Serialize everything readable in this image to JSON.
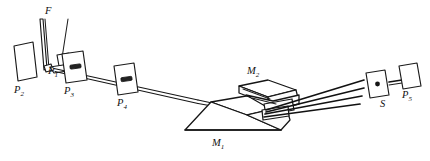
{
  "figure": {
    "background_color": "#ffffff",
    "stroke_color": "#1a1a1a",
    "width": 430,
    "height": 161,
    "type": "line-diagram"
  },
  "labels": {
    "f": {
      "text": "F",
      "subscript": "",
      "x": 45,
      "y": 6
    },
    "p1": {
      "text": "P",
      "subscript": "1",
      "x": 48,
      "y": 66
    },
    "p2": {
      "text": "P",
      "subscript": "2",
      "x": 14,
      "y": 96
    },
    "p3": {
      "text": "P",
      "subscript": "3",
      "x": 62,
      "y": 84
    },
    "p4": {
      "text": "P",
      "subscript": "4",
      "x": 115,
      "y": 100
    },
    "m1": {
      "text": "M",
      "subscript": "1",
      "x": 212,
      "y": 141
    },
    "m2": {
      "text": "M",
      "subscript": "2",
      "x": 247,
      "y": 67
    },
    "s": {
      "text": "S",
      "subscript": "",
      "x": 382,
      "y": 98
    },
    "p5": {
      "text": "P",
      "subscript": "5",
      "x": 401,
      "y": 90
    }
  },
  "components": [
    {
      "name": "plate-p2",
      "label": "P2",
      "kind": "tilted-plate"
    },
    {
      "name": "filament-f",
      "label": "F",
      "kind": "filament-slit"
    },
    {
      "name": "mount-p1",
      "label": "P1",
      "kind": "small-block-mount"
    },
    {
      "name": "plate-p3",
      "label": "P3",
      "kind": "slotted-plate"
    },
    {
      "name": "plate-p4",
      "label": "P4",
      "kind": "slotted-plate"
    },
    {
      "name": "prism-m1",
      "label": "M1",
      "kind": "large-prism-base"
    },
    {
      "name": "prism-m2",
      "label": "M2",
      "kind": "upper-prism-block"
    },
    {
      "name": "slit-s",
      "label": "S",
      "kind": "slit-aperture"
    },
    {
      "name": "plate-p5",
      "label": "P5",
      "kind": "tilted-plate"
    }
  ],
  "rays": {
    "count": 4,
    "description": "Beam enters along collimator tube through P3 and P4 to prism M1/M2, then fans out toward slit S."
  }
}
